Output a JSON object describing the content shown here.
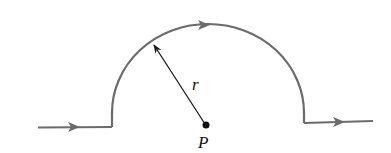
{
  "diagram": {
    "labels": {
      "radius": "r",
      "point": "P"
    },
    "colors": {
      "wire": "#6b6b6b",
      "radius_line": "#1a1a1a",
      "point": "#111111",
      "background": "#ffffff"
    },
    "elements": [
      {
        "type": "straight-wire",
        "name": "incoming-left-segment",
        "direction": "right"
      },
      {
        "type": "arc",
        "name": "semicircle",
        "direction": "clockwise",
        "center": "P",
        "radius": "r"
      },
      {
        "type": "straight-wire",
        "name": "outgoing-right-segment",
        "direction": "right"
      },
      {
        "type": "vector",
        "name": "radius-arrow",
        "from": "P",
        "to": "arc"
      },
      {
        "type": "point",
        "name": "center-point",
        "label": "P"
      }
    ]
  }
}
